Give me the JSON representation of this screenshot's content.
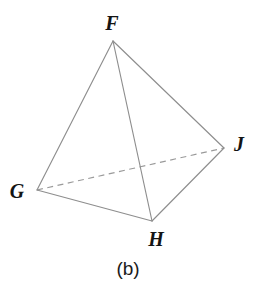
{
  "figure": {
    "caption": "(b)",
    "shape_name": "tetrahedron",
    "background_color": "#ffffff",
    "line_color": "#8e8e8e",
    "dashed_line_color": "#9a9a9a",
    "label_color": "#141414",
    "caption_color": "#1a1a1a",
    "vertices": [
      {
        "label": "F",
        "x": 113,
        "y": 41,
        "label_x": 112,
        "label_y": 25
      },
      {
        "label": "G",
        "x": 37,
        "y": 190,
        "label_x": 17,
        "label_y": 193
      },
      {
        "label": "H",
        "x": 152,
        "y": 221,
        "label_x": 156,
        "label_y": 241
      },
      {
        "label": "J",
        "x": 224,
        "y": 148,
        "label_x": 239,
        "label_y": 146
      }
    ],
    "edges": [
      {
        "name": "edge-FG",
        "from": "F",
        "to": "G",
        "style": "solid",
        "x1": 113,
        "y1": 41,
        "x2": 37,
        "y2": 190
      },
      {
        "name": "edge-FH",
        "from": "F",
        "to": "H",
        "style": "solid",
        "x1": 113,
        "y1": 41,
        "x2": 152,
        "y2": 221
      },
      {
        "name": "edge-FJ",
        "from": "F",
        "to": "J",
        "style": "solid",
        "x1": 113,
        "y1": 41,
        "x2": 224,
        "y2": 148
      },
      {
        "name": "edge-GH",
        "from": "G",
        "to": "H",
        "style": "solid",
        "x1": 37,
        "y1": 190,
        "x2": 152,
        "y2": 221
      },
      {
        "name": "edge-HJ",
        "from": "H",
        "to": "J",
        "style": "solid",
        "x1": 152,
        "y1": 221,
        "x2": 224,
        "y2": 148
      },
      {
        "name": "edge-GJ",
        "from": "G",
        "to": "J",
        "style": "dashed",
        "x1": 37,
        "y1": 190,
        "x2": 224,
        "y2": 148
      }
    ],
    "caption_x": 128,
    "caption_y": 270
  }
}
